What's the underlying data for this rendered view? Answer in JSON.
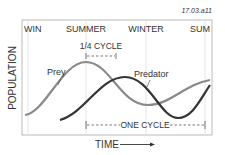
{
  "figure_id": "17.03.a11",
  "seasons": [
    {
      "label": "WIN",
      "x": 28
    },
    {
      "label": "SUMMER",
      "x": 86
    },
    {
      "label": "WINTER",
      "x": 146
    },
    {
      "label": "SUM",
      "x": 205
    }
  ],
  "axes": {
    "ylabel": "POPULATION",
    "xlabel": "TIME"
  },
  "annotations": {
    "quarter_cycle": "1/4 CYCLE",
    "one_cycle": "ONE CYCLE"
  },
  "series": [
    {
      "name": "Prey",
      "color": "#8a8a8a"
    },
    {
      "name": "Predator",
      "color": "#333333"
    }
  ],
  "colors": {
    "frame": "#bbbbbb",
    "grid": "#dddddd",
    "text": "#333333",
    "figure_id": "#888888"
  }
}
